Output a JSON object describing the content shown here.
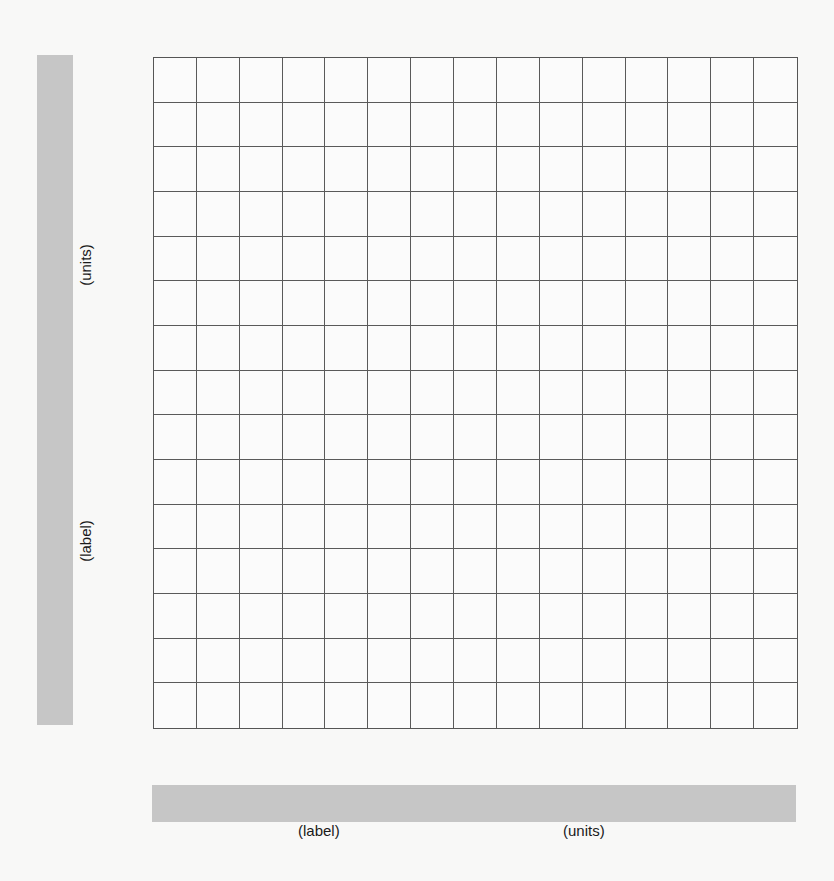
{
  "chart_data": {
    "type": "table",
    "title": "",
    "grid": {
      "columns": 15,
      "rows": 15,
      "gridlines": true
    },
    "xlabel": "(label)",
    "xunits": "(units)",
    "ylabel": "(label)",
    "yunits": "(units)",
    "series": [],
    "label_bar_color": "#c6c6c6",
    "gridline_color": "#5a5a5a"
  },
  "y_axis": {
    "label": "(label)",
    "units": "(units)"
  },
  "x_axis": {
    "label": "(label)",
    "units": "(units)"
  }
}
